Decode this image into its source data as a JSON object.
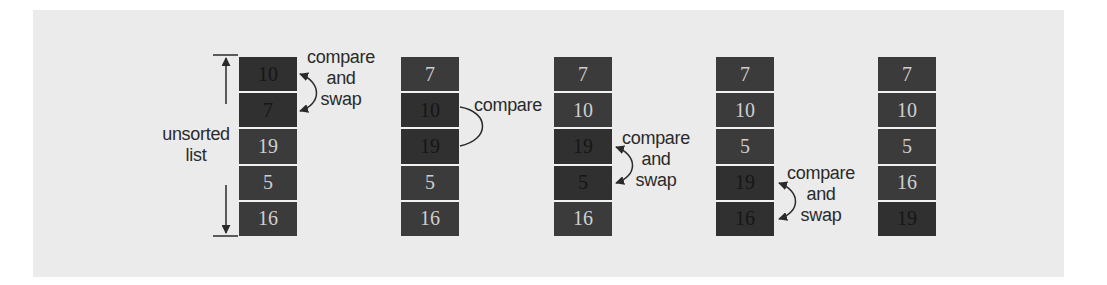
{
  "diagram": {
    "side_label_line1": "unsorted",
    "side_label_line2": "list",
    "columns": [
      {
        "cells": [
          {
            "value": "10",
            "active": true
          },
          {
            "value": "7",
            "active": true
          },
          {
            "value": "19",
            "active": false
          },
          {
            "value": "5",
            "active": false
          },
          {
            "value": "16",
            "active": false
          }
        ],
        "annotation": [
          "compare",
          "and",
          "swap"
        ]
      },
      {
        "cells": [
          {
            "value": "7",
            "active": false
          },
          {
            "value": "10",
            "active": true
          },
          {
            "value": "19",
            "active": true
          },
          {
            "value": "5",
            "active": false
          },
          {
            "value": "16",
            "active": false
          }
        ],
        "annotation": [
          "compare"
        ]
      },
      {
        "cells": [
          {
            "value": "7",
            "active": false
          },
          {
            "value": "10",
            "active": false
          },
          {
            "value": "19",
            "active": true
          },
          {
            "value": "5",
            "active": true
          },
          {
            "value": "16",
            "active": false
          }
        ],
        "annotation": [
          "compare",
          "and",
          "swap"
        ]
      },
      {
        "cells": [
          {
            "value": "7",
            "active": false
          },
          {
            "value": "10",
            "active": false
          },
          {
            "value": "5",
            "active": false
          },
          {
            "value": "19",
            "active": true
          },
          {
            "value": "16",
            "active": true
          }
        ],
        "annotation": [
          "compare",
          "and",
          "swap"
        ]
      },
      {
        "cells": [
          {
            "value": "7",
            "active": false
          },
          {
            "value": "10",
            "active": false
          },
          {
            "value": "5",
            "active": false
          },
          {
            "value": "16",
            "active": false
          },
          {
            "value": "19",
            "active": true
          }
        ],
        "annotation": []
      }
    ],
    "colors": {
      "panel": "#ebebeb",
      "cell": "#3b3b3b",
      "cell_active": "#303030",
      "text_light": "#cfcfcf",
      "text_dark": "#161616",
      "annotation": "#2a2a2a"
    }
  }
}
